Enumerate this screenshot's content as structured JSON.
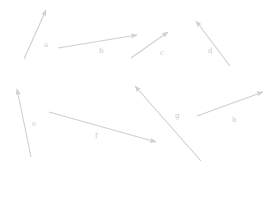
{
  "figure": {
    "width": 276,
    "height": 200,
    "background": "#ffffff",
    "stroke_color": "#cfcfcf",
    "label_color": "#c9c9c9",
    "stroke_width": 1.1,
    "type": "vector-arrow-diagram"
  },
  "vectors": [
    {
      "label": "a",
      "x1": 24,
      "y1": 59,
      "x2": 46,
      "y2": 10,
      "label_x": 44,
      "label_y": 42,
      "direction": "up-right"
    },
    {
      "label": "b",
      "x1": 58,
      "y1": 48,
      "x2": 137,
      "y2": 35,
      "label_x": 99,
      "label_y": 48,
      "direction": "right-slightly-up"
    },
    {
      "label": "c",
      "x1": 131,
      "y1": 58,
      "x2": 168,
      "y2": 32,
      "label_x": 160,
      "label_y": 50,
      "direction": "up-right"
    },
    {
      "label": "d",
      "x1": 230,
      "y1": 66,
      "x2": 196,
      "y2": 21,
      "label_x": 208,
      "label_y": 48,
      "direction": "up-left"
    },
    {
      "label": "e",
      "x1": 31,
      "y1": 157,
      "x2": 17,
      "y2": 89,
      "label_x": 32,
      "label_y": 121,
      "direction": "up-slightly-left"
    },
    {
      "label": "f",
      "x1": 49,
      "y1": 112,
      "x2": 156,
      "y2": 142,
      "label_x": 95,
      "label_y": 133,
      "direction": "right-down"
    },
    {
      "label": "g",
      "x1": 201,
      "y1": 161,
      "x2": 135,
      "y2": 86,
      "label_x": 175,
      "label_y": 113,
      "direction": "up-left"
    },
    {
      "label": "h",
      "x1": 197,
      "y1": 116,
      "x2": 263,
      "y2": 92,
      "label_x": 232,
      "label_y": 117,
      "direction": "up-right"
    }
  ]
}
